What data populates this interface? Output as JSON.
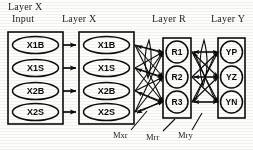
{
  "figure": {
    "type": "neural-network-architecture-diagram",
    "background_color": "#fdfdfb",
    "ink_color": "#111111"
  },
  "headers": {
    "layer_x_input_line1": "Layer X",
    "layer_x_input_line2": "Input",
    "layer_x": "Layer X",
    "layer_r": "Layer R",
    "layer_y": "Layer Y"
  },
  "layers": [
    {
      "id": "layer-x-input",
      "title": "Layer X Input",
      "shape": "ellipse",
      "nodes": [
        {
          "id": "xi-x1b",
          "label": "X1B"
        },
        {
          "id": "xi-x1s",
          "label": "X1S"
        },
        {
          "id": "xi-x2b",
          "label": "X2B"
        },
        {
          "id": "xi-x2s",
          "label": "X2S"
        }
      ]
    },
    {
      "id": "layer-x",
      "title": "Layer X",
      "shape": "ellipse",
      "nodes": [
        {
          "id": "x-x1b",
          "label": "X1B"
        },
        {
          "id": "x-x1s",
          "label": "X1S"
        },
        {
          "id": "x-x2b",
          "label": "X2B"
        },
        {
          "id": "x-x2s",
          "label": "X2S"
        }
      ]
    },
    {
      "id": "layer-r",
      "title": "Layer R",
      "shape": "circle",
      "nodes": [
        {
          "id": "r-r1",
          "label": "R1"
        },
        {
          "id": "r-r2",
          "label": "R2"
        },
        {
          "id": "r-r3",
          "label": "R3"
        }
      ]
    },
    {
      "id": "layer-y",
      "title": "Layer Y",
      "shape": "circle",
      "nodes": [
        {
          "id": "y-yp",
          "label": "YP"
        },
        {
          "id": "y-yz",
          "label": "YZ"
        },
        {
          "id": "y-yn",
          "label": "YN"
        }
      ]
    }
  ],
  "weight_labels": [
    {
      "id": "mxr",
      "label": "Mxr",
      "describes": "connections from Layer X to Layer R"
    },
    {
      "id": "mrr",
      "label": "Mrr",
      "describes": "recurrent connections within Layer R"
    },
    {
      "id": "mry",
      "label": "Mry",
      "describes": "connections from Layer R to Layer Y"
    }
  ],
  "connections": {
    "input_to_x": "one-to-one arrows",
    "x_to_r": "fully connected",
    "r_recurrent": "self/lateral loop",
    "r_to_y": "fully connected"
  }
}
